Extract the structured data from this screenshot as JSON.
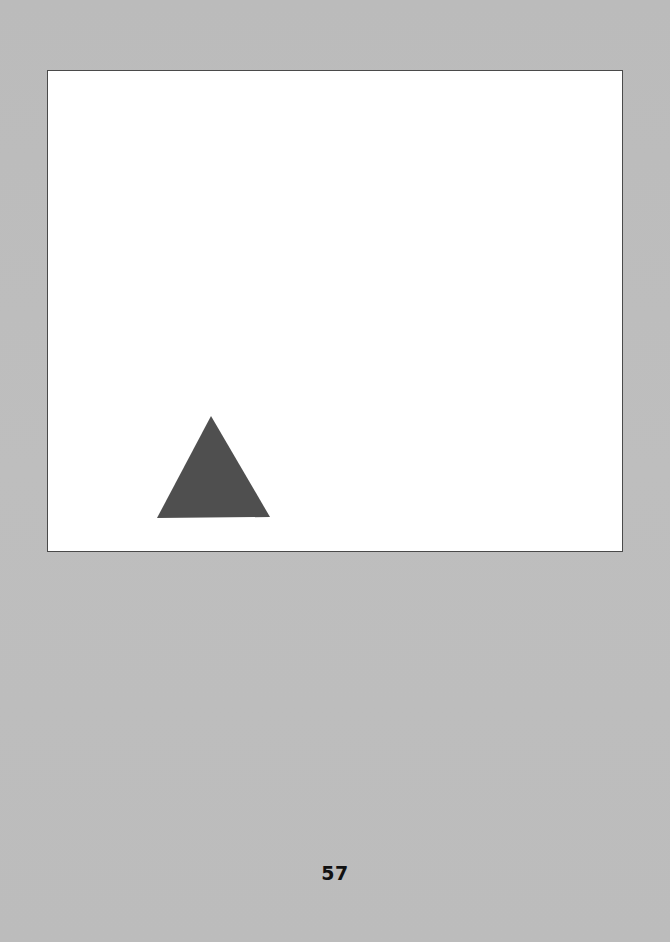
{
  "page": {
    "background_color": "#bdbdbd",
    "page_number": "57"
  },
  "figure": {
    "frame_color": "#ffffff",
    "border_color": "#4a4a4a",
    "shapes": [
      {
        "type": "triangle",
        "fill": "#4f4f4f",
        "points": [
          [
            210,
            415
          ],
          [
            156,
            517
          ],
          [
            269,
            516
          ]
        ]
      }
    ]
  }
}
